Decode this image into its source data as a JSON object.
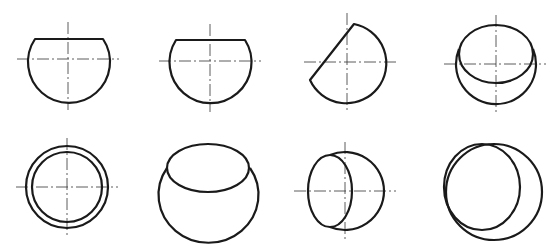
{
  "figure": {
    "colors": {
      "line": "#1a1a1a",
      "centerline": "#333333",
      "background": "#ffffff"
    },
    "views": [
      {
        "id": "v1",
        "row": 1,
        "col": 1,
        "shape": "sphere-truncated-horizontal-top"
      },
      {
        "id": "v2",
        "row": 1,
        "col": 2,
        "shape": "sphere-truncated-horizontal-top"
      },
      {
        "id": "v3",
        "row": 1,
        "col": 3,
        "shape": "sphere-truncated-oblique"
      },
      {
        "id": "v4",
        "row": 1,
        "col": 4,
        "shape": "sphere-with-elliptic-cut-top"
      },
      {
        "id": "v5",
        "row": 2,
        "col": 1,
        "shape": "concentric-circles"
      },
      {
        "id": "v6",
        "row": 2,
        "col": 2,
        "shape": "sphere-with-elliptic-opening-top"
      },
      {
        "id": "v7",
        "row": 2,
        "col": 3,
        "shape": "sphere-with-elliptic-cut-left"
      },
      {
        "id": "v8",
        "row": 2,
        "col": 4,
        "shape": "sphere-with-offset-circle-cut"
      }
    ]
  }
}
